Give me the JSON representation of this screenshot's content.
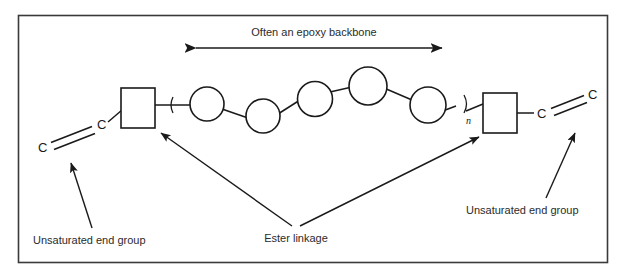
{
  "figure": {
    "title_label": "Often an epoxy backbone",
    "border_color": "#3a3a3a",
    "line_color": "#1a1a1a",
    "text_color": "#2b2b2b",
    "background": "#ffffff"
  },
  "annotations": {
    "backbone": "Often an epoxy backbone",
    "ester": "Ester linkage",
    "end_group_left": "Unsaturated end group",
    "end_group_right": "Unsaturated end group"
  },
  "structure": {
    "repeat_subscript": "n",
    "atoms": {
      "left_outer": "C",
      "left_inner": "C",
      "right_inner": "C",
      "right_outer": "C"
    },
    "backbone_unit_count": 6,
    "ester_group_count": 2
  }
}
